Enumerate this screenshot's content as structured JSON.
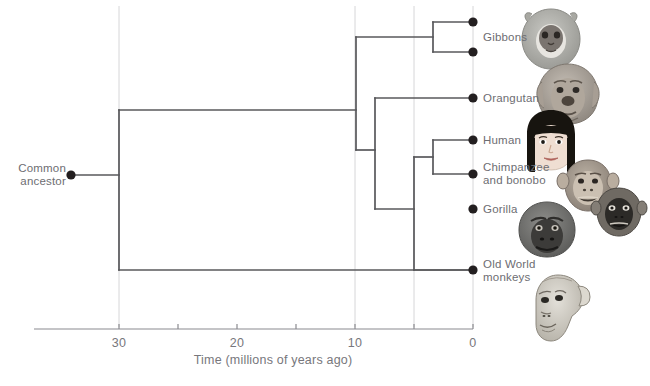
{
  "figure": {
    "type": "phylogenetic-tree-diagram",
    "axis_title": "Time (millions of years ago)",
    "root_label": "Common\nancestor"
  },
  "axis": {
    "label": "Time (millions of years ago)",
    "direction": "reversed",
    "range_mya": [
      30,
      0
    ],
    "ticks": [
      {
        "value": 30,
        "label": "30",
        "x": 119,
        "major": true
      },
      {
        "value": 25,
        "label": "",
        "x": 178,
        "major": false
      },
      {
        "value": 20,
        "label": "20",
        "x": 237,
        "major": true
      },
      {
        "value": 15,
        "label": "",
        "x": 296,
        "major": false
      },
      {
        "value": 10,
        "label": "10",
        "x": 355,
        "major": true
      },
      {
        "value": 5,
        "label": "",
        "x": 414,
        "major": false
      },
      {
        "value": 0,
        "label": "0",
        "x": 473,
        "major": true
      }
    ],
    "gridlines_mya": [
      30,
      10,
      5,
      0
    ],
    "line_x_start": 34,
    "line_x_end": 473,
    "line_y": 329
  },
  "tips": [
    {
      "id": "gibbon-a",
      "label": "",
      "x": 473,
      "y": 22,
      "label_x": 483,
      "label_y": 30
    },
    {
      "id": "gibbon-b",
      "label": "Gibbons",
      "x": 473,
      "y": 52,
      "label_x": 483,
      "label_y": 31
    },
    {
      "id": "orangutan",
      "label": "Orangutan",
      "x": 473,
      "y": 98,
      "label_x": 483,
      "label_y": 92
    },
    {
      "id": "human",
      "label": "Human",
      "x": 473,
      "y": 140,
      "label_x": 483,
      "label_y": 134
    },
    {
      "id": "chimpanzee-bonobo",
      "label": "Chimpanzee\nand bonobo",
      "x": 473,
      "y": 174,
      "label_x": 483,
      "label_y": 161
    },
    {
      "id": "gorilla",
      "label": "Gorilla",
      "x": 473,
      "y": 209,
      "label_x": 483,
      "label_y": 203
    },
    {
      "id": "old-world-monkeys",
      "label": "Old World\nmonkeys",
      "x": 473,
      "y": 270,
      "label_x": 483,
      "label_y": 258
    }
  ],
  "nodes": [
    {
      "id": "common-ancestor",
      "x": 71,
      "y": 175,
      "mya": 34.0,
      "dot": true
    },
    {
      "id": "root-split",
      "x": 119,
      "y": 175,
      "mya": 30.0,
      "dot": false
    },
    {
      "id": "ape-node",
      "x": 356,
      "y": 110,
      "mya": 9.9,
      "dot": false
    },
    {
      "id": "gibbon-node",
      "x": 433,
      "y": 37,
      "mya": 3.4,
      "dot": false
    },
    {
      "id": "orangutan-node",
      "x": 375,
      "y": 150,
      "mya": 8.3,
      "dot": false
    },
    {
      "id": "great-ape-node",
      "x": 414,
      "y": 191,
      "mya": 5.0,
      "dot": false
    },
    {
      "id": "chimp-gorilla-node",
      "x": 433,
      "y": 157,
      "mya": 3.4,
      "dot": false
    }
  ],
  "branches": [
    {
      "id": "ancestor-stem",
      "type": "h",
      "x1": 71,
      "x2": 119,
      "y": 175
    },
    {
      "id": "root-vertical",
      "type": "v",
      "x": 119,
      "y1": 110,
      "y2": 270
    },
    {
      "id": "apes-branch",
      "type": "h",
      "x1": 119,
      "x2": 356,
      "y": 110
    },
    {
      "id": "owm-branch",
      "type": "h",
      "x1": 119,
      "x2": 473,
      "y": 270
    },
    {
      "id": "ape-vertical",
      "type": "v",
      "x": 356,
      "y1": 37,
      "y2": 150
    },
    {
      "id": "gibbon-branch",
      "type": "h",
      "x1": 356,
      "x2": 433,
      "y": 37
    },
    {
      "id": "gibbon-vertical",
      "type": "v",
      "x": 433,
      "y1": 22,
      "y2": 52
    },
    {
      "id": "gibbon-a-tip",
      "type": "h",
      "x1": 433,
      "x2": 473,
      "y": 22
    },
    {
      "id": "gibbon-b-tip",
      "type": "h",
      "x1": 433,
      "x2": 473,
      "y": 52
    },
    {
      "id": "orang-branch",
      "type": "h",
      "x1": 356,
      "x2": 375,
      "y": 150
    },
    {
      "id": "orang-vertical",
      "type": "v",
      "x": 375,
      "y1": 98,
      "y2": 209
    },
    {
      "id": "orang-tip",
      "type": "h",
      "x1": 375,
      "x2": 473,
      "y": 98
    },
    {
      "id": "greatape-branch",
      "type": "h",
      "x1": 375,
      "x2": 414,
      "y": 209
    },
    {
      "id": "greatape-vert",
      "type": "v",
      "x": 414,
      "y1": 157,
      "y2": 270
    },
    {
      "id": "gorilla-tip",
      "type": "h",
      "x1": 414,
      "x2": 473,
      "y": 270
    },
    {
      "id": "chimpgor-branch",
      "type": "h",
      "x1": 414,
      "x2": 433,
      "y": 157
    },
    {
      "id": "chimpgor-vert",
      "type": "v",
      "x": 433,
      "y1": 140,
      "y2": 174
    },
    {
      "id": "human-tip",
      "type": "h",
      "x1": 433,
      "x2": 473,
      "y": 140
    },
    {
      "id": "chimp-tip",
      "type": "h",
      "x1": 433,
      "x2": 473,
      "y": 174
    }
  ],
  "illustrations": [
    {
      "id": "gibbon-face",
      "name": "gibbon-face-illustration",
      "x": 520,
      "y": 8,
      "w": 62,
      "h": 62
    },
    {
      "id": "orangutan-face",
      "name": "orangutan-face-illustration",
      "x": 536,
      "y": 62,
      "w": 64,
      "h": 64
    },
    {
      "id": "human-face",
      "name": "human-face-illustration",
      "x": 524,
      "y": 110,
      "w": 54,
      "h": 62
    },
    {
      "id": "chimpanzee-face",
      "name": "chimpanzee-face-illustration",
      "x": 560,
      "y": 158,
      "w": 56,
      "h": 54
    },
    {
      "id": "bonobo-face",
      "name": "bonobo-face-illustration",
      "x": 592,
      "y": 186,
      "w": 54,
      "h": 50
    },
    {
      "id": "gorilla-face",
      "name": "gorilla-face-illustration",
      "x": 516,
      "y": 200,
      "w": 62,
      "h": 58
    },
    {
      "id": "monkey-face",
      "name": "old-world-monkey-illustration",
      "x": 528,
      "y": 272,
      "w": 62,
      "h": 70
    }
  ],
  "colors": {
    "line": "#58585b",
    "grid": "#d6d6d8",
    "axis": "#8a8a8f",
    "text": "#6d6d72",
    "dot": "#231f20",
    "background": "#ffffff"
  }
}
